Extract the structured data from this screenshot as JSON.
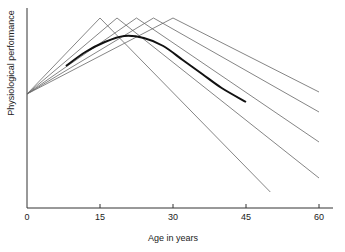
{
  "chart_data": {
    "type": "line",
    "title": "",
    "xlabel": "Age in years",
    "ylabel": "Physiological performance",
    "xlim": [
      0,
      62
    ],
    "ylim": [
      0,
      100
    ],
    "x_ticks": [
      0,
      15,
      30,
      45,
      60
    ],
    "y_ticks": [],
    "grid": false,
    "legend": null,
    "series": [
      {
        "name": "individual-1",
        "style": "thin",
        "points": [
          [
            0,
            57
          ],
          [
            15,
            95
          ],
          [
            50,
            8
          ]
        ]
      },
      {
        "name": "individual-2",
        "style": "thin",
        "points": [
          [
            0,
            57
          ],
          [
            18.5,
            95
          ],
          [
            60,
            15
          ]
        ]
      },
      {
        "name": "individual-3",
        "style": "thin",
        "points": [
          [
            0,
            57
          ],
          [
            22.5,
            95
          ],
          [
            60,
            33
          ]
        ]
      },
      {
        "name": "individual-4",
        "style": "thin",
        "points": [
          [
            0,
            57
          ],
          [
            26,
            95
          ],
          [
            60,
            48
          ]
        ]
      },
      {
        "name": "individual-5",
        "style": "thin",
        "points": [
          [
            0,
            57
          ],
          [
            30,
            95
          ],
          [
            60,
            58
          ]
        ]
      },
      {
        "name": "average",
        "style": "thick",
        "points": [
          [
            8,
            71
          ],
          [
            12,
            78
          ],
          [
            16,
            83
          ],
          [
            20,
            86
          ],
          [
            24,
            85
          ],
          [
            28,
            81
          ],
          [
            32,
            74
          ],
          [
            36,
            67
          ],
          [
            40,
            60
          ],
          [
            45,
            53
          ]
        ]
      }
    ]
  },
  "axes": {
    "xlabel": "Age in years",
    "ylabel": "Physiological performance",
    "x_ticks": [
      "0",
      "15",
      "30",
      "45",
      "60"
    ]
  }
}
